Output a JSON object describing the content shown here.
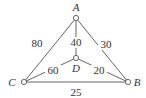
{
  "diagram": {
    "type": "weighted-graph",
    "colors": {
      "line": "#555555",
      "text": "#333333",
      "background": "#ffffff"
    },
    "nodes": [
      {
        "id": "A",
        "label": "A",
        "x": 76,
        "y": 18,
        "lx": 76,
        "ly": 11
      },
      {
        "id": "B",
        "label": "B",
        "x": 128,
        "y": 82,
        "lx": 137,
        "ly": 86
      },
      {
        "id": "C",
        "label": "C",
        "x": 24,
        "y": 82,
        "lx": 12,
        "ly": 86
      },
      {
        "id": "D",
        "label": "D",
        "x": 76,
        "y": 58,
        "lx": 76,
        "ly": 72
      }
    ],
    "edges": [
      {
        "from": "A",
        "to": "C",
        "weight": "80",
        "lx": 37,
        "ly": 47
      },
      {
        "from": "A",
        "to": "B",
        "weight": "30",
        "lx": 106,
        "ly": 48
      },
      {
        "from": "A",
        "to": "D",
        "weight": "40",
        "lx": 76,
        "ly": 46
      },
      {
        "from": "C",
        "to": "D",
        "weight": "60",
        "lx": 53,
        "ly": 74
      },
      {
        "from": "D",
        "to": "B",
        "weight": "20",
        "lx": 99,
        "ly": 74
      },
      {
        "from": "C",
        "to": "B",
        "weight": "25",
        "lx": 76,
        "ly": 96
      }
    ]
  }
}
